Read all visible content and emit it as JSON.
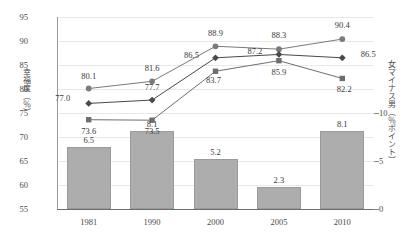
{
  "chart_data": {
    "type": "line",
    "title": "",
    "subtitle": "",
    "xlabel": "",
    "ylabel": "幸福度（％）",
    "y2label": "女マイナス男（％ポイント）",
    "categories": [
      "1981",
      "1990",
      "2000",
      "2005",
      "2010"
    ],
    "ylim": [
      55,
      95
    ],
    "y_ticks": [
      "55",
      "60",
      "65",
      "70",
      "75",
      "80",
      "85",
      "90",
      "95"
    ],
    "y2lim": [
      0,
      20
    ],
    "y2_ticks": [
      "0",
      "5",
      "10"
    ],
    "grid": true,
    "legend": "none",
    "series": [
      {
        "name": "女",
        "marker": "circle",
        "color": "#7a7a7a",
        "values": [
          80.1,
          81.6,
          88.9,
          88.3,
          90.4
        ],
        "labels": [
          "80.1",
          "81.6",
          "88.9",
          "88.3",
          "90.4"
        ]
      },
      {
        "name": "計",
        "marker": "diamond",
        "color": "#4a4a4a",
        "values": [
          77.0,
          77.7,
          86.5,
          87.2,
          86.5
        ],
        "labels": [
          "77.0",
          "77.7",
          "86.5",
          "87.2",
          "86.5"
        ]
      },
      {
        "name": "男",
        "marker": "square",
        "color": "#6e6e6e",
        "values": [
          73.6,
          73.5,
          83.7,
          85.9,
          82.2
        ],
        "labels": [
          "73.6",
          "73.5",
          "83.7",
          "85.9",
          "82.2"
        ]
      }
    ],
    "bars": {
      "name": "女マイナス男",
      "color": "#adadad",
      "values": [
        6.5,
        8.1,
        5.2,
        2.3,
        8.1
      ],
      "labels": [
        "6.5",
        "8.1",
        "5.2",
        "2.3",
        "8.1"
      ]
    }
  }
}
